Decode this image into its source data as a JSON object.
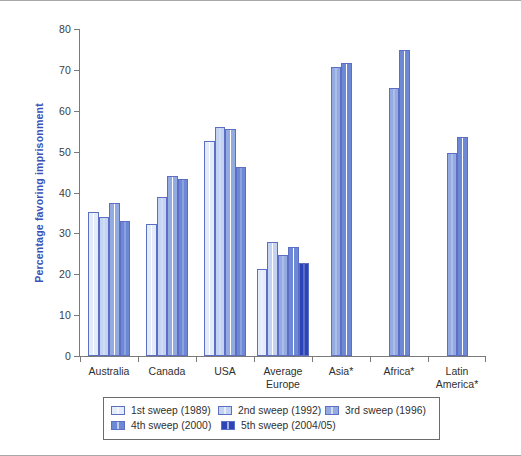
{
  "chart_data": {
    "type": "bar",
    "title": "",
    "xlabel": "",
    "ylabel": "Percentage favoring imprisonment",
    "ylim": [
      0,
      80
    ],
    "yticks": [
      0,
      10,
      20,
      30,
      40,
      50,
      60,
      70,
      80
    ],
    "ytick_labels": [
      "0",
      "10",
      "20",
      "30",
      "40",
      "50",
      "60",
      "70",
      "80"
    ],
    "grid": false,
    "legend_position": "bottom",
    "categories": [
      "Australia",
      "Canada",
      "USA",
      "Average\nEurope",
      "Asia*",
      "Africa*",
      "Latin\nAmerica*"
    ],
    "category_lines": [
      [
        "Australia"
      ],
      [
        "Canada"
      ],
      [
        "USA"
      ],
      [
        "Average",
        "Europe"
      ],
      [
        "Asia*"
      ],
      [
        "Africa*"
      ],
      [
        "Latin",
        "America*"
      ]
    ],
    "series": [
      {
        "name": "1st sweep (1989)",
        "color": "#e4ecfa",
        "values": [
          35.2,
          32.4,
          52.5,
          21.2,
          null,
          null,
          null
        ]
      },
      {
        "name": "2nd sweep (1992)",
        "color": "#c3d3f1",
        "values": [
          34.0,
          38.9,
          56.0,
          27.8,
          null,
          null,
          null
        ]
      },
      {
        "name": "3rd sweep (1996)",
        "color": "#94abe2",
        "values": [
          37.4,
          44.0,
          55.6,
          24.7,
          70.6,
          65.6,
          49.7
        ]
      },
      {
        "name": "4th sweep (2000)",
        "color": "#6d89d6",
        "values": [
          33.0,
          43.4,
          46.3,
          26.7,
          71.6,
          74.8,
          53.6
        ]
      },
      {
        "name": "5th sweep (2004/05)",
        "color": "#2b44b8",
        "values": [
          null,
          null,
          null,
          22.8,
          null,
          null,
          null
        ]
      }
    ]
  },
  "legend": {
    "rows": [
      [
        {
          "label": "1st sweep (1989)",
          "color": "#e4ecfa"
        },
        {
          "label": "2nd sweep (1992)",
          "color": "#c3d3f1"
        },
        {
          "label": "3rd sweep (1996)",
          "color": "#94abe2"
        }
      ],
      [
        {
          "label": "4th sweep (2000)",
          "color": "#6d89d6"
        },
        {
          "label": "5th sweep (2004/05)",
          "color": "#2b44b8"
        }
      ]
    ]
  },
  "colors": {
    "axis": "#7a7a7a",
    "ylabel_text": "#3a52b8",
    "tick_text": "#3c3c3c",
    "frame": "#a8a8a8",
    "bar_outline": "#5c6fc4"
  }
}
